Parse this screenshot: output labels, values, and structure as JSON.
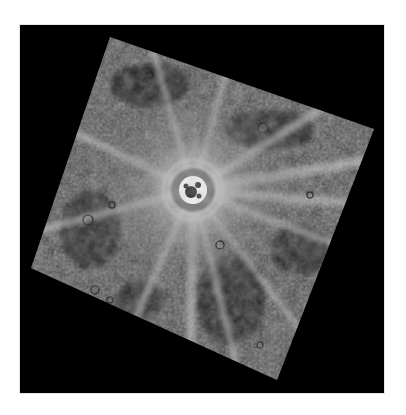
{
  "image": {
    "subject": "planetary-surface-crater-with-bright-rays",
    "background_color": "#ffffff",
    "frame_color": "#000000",
    "frame": {
      "x": 20,
      "y": 25,
      "width": 364,
      "height": 368
    },
    "footprint": {
      "corners": [
        [
          110,
          37
        ],
        [
          374,
          129
        ],
        [
          277,
          380
        ],
        [
          31,
          268
        ]
      ],
      "rotation_deg": 20
    },
    "crater": {
      "cx": 193,
      "cy": 190,
      "floor_radius": 14,
      "halo_radius": 40
    },
    "palette": {
      "terrain_dark": "#2e2e2e",
      "terrain_mid": "#5a5a5a",
      "terrain_light": "#9a9a9a",
      "ray": "#d8d8d8",
      "crater_floor": "#f2f2f2"
    }
  }
}
